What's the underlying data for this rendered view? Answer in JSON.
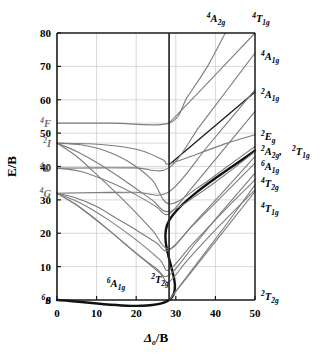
{
  "figure": {
    "title": "",
    "type": "tanabe-sugano-diagram",
    "xlabel_main": "Δ",
    "xlabel_sub": "o",
    "xlabel_rest": "/B",
    "ylabel": "E/B"
  },
  "axes": {
    "x_ticks": [
      "0",
      "10",
      "20",
      "30",
      "40",
      "50"
    ],
    "y_ticks": [
      "0",
      "10",
      "20",
      "30",
      "40",
      "50",
      "60",
      "70",
      "80"
    ],
    "xlim": [
      0,
      50
    ],
    "ylim": [
      0,
      80
    ],
    "crossover_x": "28.3"
  },
  "free_ion_terms": [
    {
      "id": "term-4F",
      "mult": "4",
      "letter": "F",
      "energy": 53.0
    },
    {
      "id": "term-2I",
      "mult": "2",
      "letter": "I",
      "energy": 47.0
    },
    {
      "id": "term-4D",
      "mult": "4",
      "letter": "D",
      "energy": 39.5
    },
    {
      "id": "term-4G",
      "mult": "4",
      "letter": "G",
      "energy": 32.0
    },
    {
      "id": "term-6S",
      "mult": "6",
      "letter": "S",
      "energy": 0.0
    }
  ],
  "top_labels": [
    {
      "id": "top-4A2g",
      "mult": "4",
      "letter": "A",
      "sub": "2g",
      "x": 216,
      "y": 22
    },
    {
      "id": "top-4T1g",
      "mult": "4",
      "letter": "T",
      "sub": "1g",
      "x": 261,
      "y": 22
    }
  ],
  "right_labels": [
    {
      "id": "right-4A1g",
      "mult": "4",
      "letter": "A",
      "sub": "1g",
      "y": 60
    },
    {
      "id": "right-2A1g",
      "mult": "2",
      "letter": "A",
      "sub": "1g",
      "y": 98
    },
    {
      "id": "right-2Eg",
      "mult": "2",
      "letter": "E",
      "sub": "g",
      "y": 140
    },
    {
      "id": "right-2A2g",
      "mult": "2",
      "letter": "A",
      "sub": "2g",
      "y": 155,
      "trailing": ","
    },
    {
      "id": "right-2T1g",
      "mult": "2",
      "letter": "T",
      "sub": "1g",
      "y": 155,
      "x": 292
    },
    {
      "id": "right-6A1g",
      "mult": "6",
      "letter": "A",
      "sub": "1g",
      "y": 170
    },
    {
      "id": "right-4T2g",
      "mult": "4",
      "letter": "T",
      "sub": "2g",
      "y": 187
    },
    {
      "id": "right-4T1g",
      "mult": "4",
      "letter": "T",
      "sub": "1g",
      "y": 212
    },
    {
      "id": "right-2T2g",
      "mult": "2",
      "letter": "T",
      "sub": "2g",
      "y": 300
    }
  ],
  "inner_labels": [
    {
      "id": "inner-6A1g",
      "mult": "6",
      "letter": "A",
      "sub": "1g",
      "x": 116,
      "y": 287
    },
    {
      "id": "inner-2T2g",
      "mult": "2",
      "letter": "T",
      "sub": "2g",
      "x": 160,
      "y": 283
    }
  ],
  "chart_data": {
    "type": "line",
    "xlabel": "Δo/B",
    "ylabel": "E/B",
    "xlim": [
      0,
      50
    ],
    "ylim": [
      0,
      80
    ],
    "x_ticks": [
      0,
      10,
      20,
      30,
      40,
      50
    ],
    "y_ticks": [
      0,
      10,
      20,
      30,
      40,
      50,
      60,
      70,
      80
    ],
    "grid": true,
    "legend": "none",
    "crossover_x": 28.3,
    "free_ion_term_energies": {
      "6S": 0.0,
      "4G": 32.0,
      "4D": 39.5,
      "2I": 47.0,
      "4F": 53.0
    },
    "series": [
      {
        "name": "6A1g / 2T2g ground state",
        "weight": "heavy",
        "color": "#111111",
        "points": [
          [
            0,
            0
          ],
          [
            28.3,
            0
          ],
          [
            28.3,
            23.8
          ],
          [
            50,
            44.8
          ]
        ]
      },
      {
        "name": "2A1g",
        "weight": "dark",
        "color": "#1c1c1c",
        "points": [
          [
            28.3,
            40.5
          ],
          [
            50,
            62.3
          ]
        ]
      },
      {
        "name": "4T1g (from 4G)",
        "weight": "light",
        "color": "#7d7d7d",
        "points": [
          [
            0,
            32.0
          ],
          [
            5,
            28.5
          ],
          [
            10,
            24.0
          ],
          [
            15,
            19.0
          ],
          [
            20,
            14.0
          ],
          [
            25,
            9.5
          ],
          [
            28.3,
            7.4
          ],
          [
            35,
            17.0
          ],
          [
            42,
            27.0
          ],
          [
            50,
            38.0
          ]
        ]
      },
      {
        "name": "4T2g (from 4G)",
        "weight": "light",
        "color": "#7d7d7d",
        "points": [
          [
            0,
            32.0
          ],
          [
            5,
            30.5
          ],
          [
            10,
            28.0
          ],
          [
            15,
            24.5
          ],
          [
            20,
            21.0
          ],
          [
            25,
            17.2
          ],
          [
            28.3,
            15.0
          ],
          [
            35,
            23.5
          ],
          [
            42,
            32.5
          ],
          [
            50,
            43.0
          ]
        ]
      },
      {
        "name": "4Eg 4A1g (from 4G)",
        "weight": "light",
        "color": "#7d7d7d",
        "points": [
          [
            0,
            32.0
          ],
          [
            10,
            32.2
          ],
          [
            20,
            32.3
          ],
          [
            28.3,
            32.4
          ],
          [
            38,
            46.0
          ],
          [
            44,
            54.5
          ],
          [
            50,
            63.0
          ]
        ]
      },
      {
        "name": "4Eg (from 4D)",
        "weight": "light",
        "color": "#7d7d7d",
        "points": [
          [
            0,
            39.5
          ],
          [
            10,
            39.6
          ],
          [
            20,
            39.6
          ],
          [
            28.3,
            39.6
          ],
          [
            36,
            52.0
          ],
          [
            43,
            63.0
          ],
          [
            50,
            74.0
          ]
        ]
      },
      {
        "name": "4T2g (from 4D)",
        "weight": "light",
        "color": "#7d7d7d",
        "points": [
          [
            0,
            39.5
          ],
          [
            6,
            38.5
          ],
          [
            14,
            35.0
          ],
          [
            20,
            31.5
          ],
          [
            25,
            28.0
          ],
          [
            28.3,
            25.8
          ],
          [
            34,
            33.5
          ],
          [
            42,
            45.0
          ],
          [
            50,
            56.5
          ]
        ]
      },
      {
        "name": "4A2g (from 4F)",
        "weight": "light",
        "color": "#7d7d7d",
        "points": [
          [
            0,
            53.0
          ],
          [
            14,
            53.0
          ],
          [
            28.3,
            53.0
          ],
          [
            33,
            61.0
          ],
          [
            38,
            70.0
          ],
          [
            42.5,
            80.0
          ]
        ]
      },
      {
        "name": "4T1g (from 4F)",
        "weight": "light",
        "color": "#7d7d7d",
        "points": [
          [
            28.3,
            53.0
          ],
          [
            36,
            62.5
          ],
          [
            44,
            72.5
          ],
          [
            50,
            80.0
          ]
        ]
      },
      {
        "name": "2I-derived upper branch",
        "weight": "light",
        "color": "#7d7d7d",
        "points": [
          [
            0,
            47.0
          ],
          [
            8,
            46.8
          ],
          [
            16,
            46.0
          ],
          [
            22,
            44.5
          ],
          [
            27,
            41.8
          ],
          [
            28.3,
            40.8
          ],
          [
            36,
            44.0
          ],
          [
            43,
            47.0
          ],
          [
            50,
            49.5
          ]
        ]
      },
      {
        "name": "2I-derived second branch",
        "weight": "light",
        "color": "#7d7d7d",
        "points": [
          [
            0,
            47.0
          ],
          [
            6,
            46.5
          ],
          [
            12,
            44.8
          ],
          [
            18,
            41.5
          ],
          [
            24,
            36.0
          ],
          [
            28.3,
            28.8
          ],
          [
            36,
            34.0
          ],
          [
            43,
            40.0
          ],
          [
            50,
            46.0
          ]
        ]
      },
      {
        "name": "2I-derived third branch",
        "weight": "light",
        "color": "#7d7d7d",
        "points": [
          [
            0,
            47.0
          ],
          [
            5,
            44.5
          ],
          [
            11,
            40.5
          ],
          [
            18,
            35.0
          ],
          [
            24,
            30.0
          ],
          [
            28.3,
            26.5
          ],
          [
            36,
            32.0
          ],
          [
            43,
            38.0
          ],
          [
            50,
            44.5
          ]
        ]
      },
      {
        "name": "2I-derived fourth branch",
        "weight": "light",
        "color": "#7d7d7d",
        "points": [
          [
            0,
            47.0
          ],
          [
            5,
            43.0
          ],
          [
            11,
            36.5
          ],
          [
            18,
            28.5
          ],
          [
            24,
            21.0
          ],
          [
            28.3,
            15.3
          ],
          [
            34,
            22.0
          ],
          [
            42,
            31.5
          ],
          [
            50,
            41.0
          ]
        ]
      },
      {
        "name": "4G-derived low branch",
        "weight": "light",
        "color": "#7d7d7d",
        "points": [
          [
            0,
            32.0
          ],
          [
            6,
            29.0
          ],
          [
            13,
            24.0
          ],
          [
            20,
            18.0
          ],
          [
            26,
            12.0
          ],
          [
            28.3,
            9.0
          ],
          [
            34,
            16.5
          ],
          [
            42,
            26.5
          ],
          [
            50,
            36.0
          ]
        ]
      },
      {
        "name": "4G-derived lowest branch",
        "weight": "light",
        "color": "#7d7d7d",
        "points": [
          [
            0,
            32.0
          ],
          [
            6,
            27.5
          ],
          [
            13,
            21.0
          ],
          [
            20,
            14.0
          ],
          [
            26,
            8.0
          ],
          [
            28.3,
            5.5
          ],
          [
            33,
            12.0
          ],
          [
            40,
            21.0
          ],
          [
            50,
            33.0
          ]
        ]
      },
      {
        "name": "2T2g rising from origin",
        "weight": "light",
        "color": "#7d7d7d",
        "points": [
          [
            28.3,
            0
          ],
          [
            34,
            8.5
          ],
          [
            41,
            19.0
          ],
          [
            50,
            32.5
          ]
        ]
      },
      {
        "name": "2T1g rising from origin",
        "weight": "light",
        "color": "#7d7d7d",
        "points": [
          [
            28.3,
            0
          ],
          [
            36,
            12.0
          ],
          [
            43,
            23.0
          ],
          [
            50,
            34.5
          ]
        ]
      }
    ]
  }
}
